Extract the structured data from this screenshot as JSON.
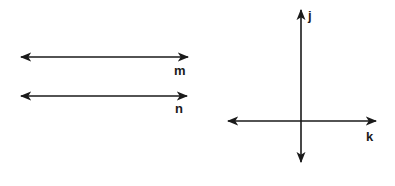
{
  "diagram": {
    "color": "#1a1a1a",
    "background": "#ffffff",
    "lines": [
      {
        "id": "m",
        "label": "m",
        "orientation": "horizontal",
        "x1": 21,
        "y1": 57,
        "x2": 188,
        "y2": 57,
        "label_x": 174,
        "label_y": 75
      },
      {
        "id": "n",
        "label": "n",
        "orientation": "horizontal",
        "x1": 21,
        "y1": 96,
        "x2": 187,
        "y2": 96,
        "label_x": 175,
        "label_y": 113
      },
      {
        "id": "j",
        "label": "j",
        "orientation": "vertical",
        "x1": 301,
        "y1": 10,
        "x2": 301,
        "y2": 162,
        "label_x": 308,
        "label_y": 20
      },
      {
        "id": "k",
        "label": "k",
        "orientation": "horizontal",
        "x1": 228,
        "y1": 121,
        "x2": 376,
        "y2": 121,
        "label_x": 366,
        "label_y": 141
      }
    ]
  }
}
